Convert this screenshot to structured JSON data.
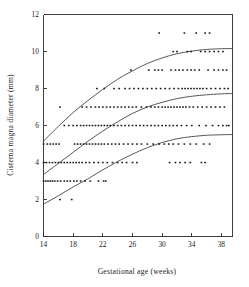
{
  "chart_data": {
    "type": "scatter",
    "title": "",
    "xlabel": "Gestational age (weeks)",
    "ylabel": "Cisterna magna diameter (mm)",
    "xlim": [
      14,
      39.5
    ],
    "ylim": [
      0,
      12
    ],
    "xticks": [
      14,
      18,
      22,
      26,
      30,
      34,
      38
    ],
    "yticks": [
      0,
      2,
      4,
      6,
      8,
      10,
      12
    ],
    "xtick_labels": [
      "14",
      "18",
      "22",
      "26",
      "30",
      "34",
      "38"
    ],
    "ytick_labels": [
      "0",
      "2",
      "4",
      "6",
      "8",
      "10",
      "12"
    ],
    "grid": false,
    "legend": "none",
    "marker": "dot",
    "marker_color": "#161616",
    "curve_color": "#3a3a3a",
    "series": [
      {
        "name": "Observations",
        "type": "scatter",
        "points": [
          [
            14.0,
            3
          ],
          [
            14.3,
            3
          ],
          [
            14.6,
            3
          ],
          [
            14.9,
            3
          ],
          [
            15.2,
            3
          ],
          [
            15.5,
            3
          ],
          [
            15.9,
            3
          ],
          [
            16.3,
            3
          ],
          [
            16.8,
            3
          ],
          [
            17.2,
            3
          ],
          [
            17.6,
            3
          ],
          [
            18.1,
            3
          ],
          [
            18.5,
            3
          ],
          [
            19.0,
            3
          ],
          [
            19.6,
            3
          ],
          [
            20.3,
            3
          ],
          [
            21.4,
            3
          ],
          [
            22.1,
            3
          ],
          [
            22.4,
            3
          ],
          [
            16.2,
            2
          ],
          [
            17.8,
            2
          ],
          [
            14.0,
            4
          ],
          [
            14.4,
            4
          ],
          [
            14.8,
            4
          ],
          [
            15.2,
            4
          ],
          [
            15.6,
            4
          ],
          [
            16.0,
            4
          ],
          [
            16.4,
            4
          ],
          [
            16.8,
            4
          ],
          [
            17.2,
            4
          ],
          [
            17.6,
            4
          ],
          [
            18.0,
            4
          ],
          [
            18.4,
            4
          ],
          [
            18.8,
            4
          ],
          [
            19.2,
            4
          ],
          [
            19.7,
            4
          ],
          [
            20.2,
            4
          ],
          [
            20.8,
            4
          ],
          [
            21.4,
            4
          ],
          [
            22.0,
            4
          ],
          [
            22.6,
            4
          ],
          [
            23.3,
            4
          ],
          [
            24.0,
            4
          ],
          [
            24.6,
            4
          ],
          [
            25.2,
            4
          ],
          [
            26.0,
            4
          ],
          [
            26.6,
            4
          ],
          [
            31.0,
            4
          ],
          [
            31.8,
            4
          ],
          [
            32.4,
            4
          ],
          [
            33.1,
            4
          ],
          [
            33.8,
            4
          ],
          [
            35.3,
            4
          ],
          [
            35.8,
            4
          ],
          [
            14.0,
            5
          ],
          [
            14.5,
            5
          ],
          [
            14.9,
            5
          ],
          [
            15.3,
            5
          ],
          [
            15.7,
            5
          ],
          [
            16.1,
            5
          ],
          [
            18.2,
            5
          ],
          [
            18.6,
            5
          ],
          [
            19.0,
            5
          ],
          [
            19.4,
            5
          ],
          [
            19.8,
            5
          ],
          [
            20.2,
            5
          ],
          [
            20.6,
            5
          ],
          [
            21.0,
            5
          ],
          [
            21.4,
            5
          ],
          [
            21.8,
            5
          ],
          [
            22.2,
            5
          ],
          [
            22.7,
            5
          ],
          [
            23.2,
            5
          ],
          [
            23.7,
            5
          ],
          [
            24.2,
            5
          ],
          [
            24.8,
            5
          ],
          [
            25.4,
            5
          ],
          [
            26.0,
            5
          ],
          [
            26.6,
            5
          ],
          [
            27.2,
            5
          ],
          [
            28.0,
            5
          ],
          [
            28.8,
            5
          ],
          [
            29.6,
            5
          ],
          [
            30.3,
            5
          ],
          [
            30.9,
            5
          ],
          [
            31.5,
            5
          ],
          [
            32.2,
            5
          ],
          [
            33.0,
            5
          ],
          [
            33.8,
            5
          ],
          [
            34.6,
            5
          ],
          [
            35.6,
            5
          ],
          [
            36.4,
            5
          ],
          [
            16.8,
            6
          ],
          [
            17.4,
            6
          ],
          [
            18.0,
            6
          ],
          [
            18.5,
            6
          ],
          [
            19.0,
            6
          ],
          [
            19.4,
            6
          ],
          [
            19.8,
            6
          ],
          [
            20.2,
            6
          ],
          [
            20.6,
            6
          ],
          [
            21.0,
            6
          ],
          [
            21.4,
            6
          ],
          [
            21.8,
            6
          ],
          [
            22.2,
            6
          ],
          [
            22.6,
            6
          ],
          [
            23.0,
            6
          ],
          [
            23.5,
            6
          ],
          [
            24.0,
            6
          ],
          [
            24.5,
            6
          ],
          [
            25.0,
            6
          ],
          [
            25.5,
            6
          ],
          [
            26.0,
            6
          ],
          [
            26.5,
            6
          ],
          [
            27.0,
            6
          ],
          [
            27.5,
            6
          ],
          [
            28.0,
            6
          ],
          [
            28.5,
            6
          ],
          [
            29.0,
            6
          ],
          [
            29.5,
            6
          ],
          [
            30.0,
            6
          ],
          [
            30.5,
            6
          ],
          [
            31.0,
            6
          ],
          [
            31.5,
            6
          ],
          [
            32.0,
            6
          ],
          [
            32.6,
            6
          ],
          [
            33.3,
            6
          ],
          [
            34.0,
            6
          ],
          [
            35.0,
            6
          ],
          [
            35.9,
            6
          ],
          [
            36.8,
            6
          ],
          [
            37.6,
            6
          ],
          [
            38.2,
            6
          ],
          [
            38.7,
            6
          ],
          [
            39.0,
            6
          ],
          [
            16.2,
            7
          ],
          [
            19.2,
            7
          ],
          [
            19.8,
            7
          ],
          [
            20.4,
            7
          ],
          [
            21.0,
            7
          ],
          [
            21.5,
            7
          ],
          [
            22.0,
            7
          ],
          [
            22.5,
            7
          ],
          [
            23.0,
            7
          ],
          [
            23.5,
            7
          ],
          [
            24.0,
            7
          ],
          [
            24.5,
            7
          ],
          [
            25.0,
            7
          ],
          [
            25.5,
            7
          ],
          [
            26.0,
            7
          ],
          [
            26.5,
            7
          ],
          [
            27.2,
            7
          ],
          [
            27.9,
            7
          ],
          [
            28.5,
            7
          ],
          [
            29.0,
            7
          ],
          [
            29.5,
            7
          ],
          [
            30.0,
            7
          ],
          [
            30.4,
            7
          ],
          [
            30.8,
            7
          ],
          [
            31.2,
            7
          ],
          [
            31.6,
            7
          ],
          [
            32.0,
            7
          ],
          [
            32.4,
            7
          ],
          [
            32.8,
            7
          ],
          [
            33.2,
            7
          ],
          [
            33.7,
            7
          ],
          [
            34.2,
            7
          ],
          [
            34.8,
            7
          ],
          [
            35.4,
            7
          ],
          [
            36.0,
            7
          ],
          [
            36.6,
            7
          ],
          [
            37.2,
            7
          ],
          [
            37.8,
            7
          ],
          [
            38.4,
            7
          ],
          [
            21.2,
            8
          ],
          [
            22.2,
            8
          ],
          [
            23.5,
            8
          ],
          [
            24.2,
            8
          ],
          [
            25.0,
            8
          ],
          [
            25.6,
            8
          ],
          [
            26.2,
            8
          ],
          [
            26.8,
            8
          ],
          [
            27.4,
            8
          ],
          [
            28.0,
            8
          ],
          [
            28.6,
            8
          ],
          [
            29.2,
            8
          ],
          [
            29.8,
            8
          ],
          [
            30.4,
            8
          ],
          [
            31.0,
            8
          ],
          [
            31.6,
            8
          ],
          [
            32.2,
            8
          ],
          [
            32.7,
            8
          ],
          [
            33.1,
            8
          ],
          [
            33.5,
            8
          ],
          [
            33.9,
            8
          ],
          [
            34.3,
            8
          ],
          [
            34.7,
            8
          ],
          [
            35.1,
            8
          ],
          [
            35.5,
            8
          ],
          [
            36.0,
            8
          ],
          [
            36.6,
            8
          ],
          [
            37.2,
            8
          ],
          [
            37.8,
            8
          ],
          [
            38.4,
            8
          ],
          [
            38.9,
            8
          ],
          [
            25.8,
            9
          ],
          [
            28.2,
            9
          ],
          [
            29.0,
            9
          ],
          [
            29.5,
            9
          ],
          [
            30.0,
            9
          ],
          [
            31.2,
            9
          ],
          [
            31.8,
            9
          ],
          [
            32.3,
            9
          ],
          [
            32.8,
            9
          ],
          [
            33.4,
            9
          ],
          [
            33.9,
            9
          ],
          [
            34.4,
            9
          ],
          [
            35.0,
            9
          ],
          [
            36.2,
            9
          ],
          [
            37.0,
            9
          ],
          [
            37.6,
            9
          ],
          [
            38.2,
            9
          ],
          [
            38.7,
            9
          ],
          [
            31.5,
            10
          ],
          [
            32.0,
            10
          ],
          [
            33.4,
            10
          ],
          [
            33.9,
            10
          ],
          [
            35.2,
            10
          ],
          [
            35.8,
            10
          ],
          [
            36.4,
            10
          ],
          [
            37.0,
            10
          ],
          [
            37.6,
            10
          ],
          [
            38.2,
            10
          ],
          [
            29.6,
            11
          ],
          [
            33.0,
            11
          ],
          [
            34.6,
            11
          ],
          [
            35.8,
            11
          ],
          [
            36.4,
            11
          ]
        ]
      },
      {
        "name": "Upper percentile curve",
        "type": "line",
        "x": [
          14,
          16,
          18,
          20,
          22,
          24,
          26,
          28,
          30,
          32,
          34,
          36,
          38,
          39.5
        ],
        "y": [
          5.15,
          5.95,
          6.7,
          7.35,
          7.95,
          8.5,
          8.95,
          9.35,
          9.65,
          9.88,
          10.02,
          10.11,
          10.15,
          10.16
        ]
      },
      {
        "name": "Median curve",
        "type": "line",
        "x": [
          14,
          16,
          18,
          20,
          22,
          24,
          26,
          28,
          30,
          32,
          34,
          36,
          38,
          39.5
        ],
        "y": [
          3.35,
          3.95,
          4.55,
          5.15,
          5.7,
          6.2,
          6.65,
          7.0,
          7.25,
          7.45,
          7.58,
          7.66,
          7.71,
          7.73
        ]
      },
      {
        "name": "Lower percentile curve",
        "type": "line",
        "x": [
          14,
          16,
          18,
          20,
          22,
          24,
          26,
          28,
          30,
          32,
          34,
          36,
          38,
          39.5
        ],
        "y": [
          1.75,
          2.2,
          2.68,
          3.12,
          3.6,
          4.05,
          4.45,
          4.8,
          5.08,
          5.28,
          5.4,
          5.47,
          5.5,
          5.51
        ]
      }
    ]
  }
}
